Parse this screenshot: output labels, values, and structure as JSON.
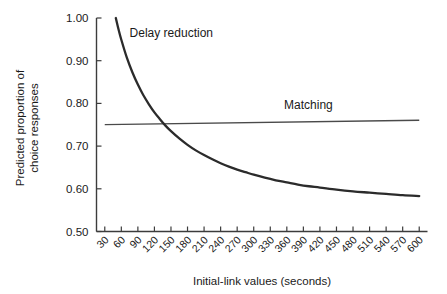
{
  "chart_data": {
    "type": "line",
    "title": "",
    "xlabel": "Initial-link values (seconds)",
    "ylabel": "Predicted proportion of choice responses",
    "xlim": [
      15,
      615
    ],
    "ylim": [
      0.5,
      1.0
    ],
    "grid": false,
    "legend_position": "inline-annotation",
    "xticks": [
      30,
      60,
      90,
      120,
      150,
      180,
      210,
      240,
      270,
      300,
      330,
      360,
      390,
      420,
      450,
      480,
      510,
      540,
      570,
      600
    ],
    "xtick_labels": [
      "30",
      "60",
      "90",
      "120",
      "150",
      "180",
      "210",
      "240",
      "270",
      "300",
      "330",
      "360",
      "390",
      "420",
      "450",
      "480",
      "510",
      "540",
      "570",
      "600"
    ],
    "xtick_rotation_deg": 45,
    "yticks": [
      0.5,
      0.6,
      0.7,
      0.8,
      0.9,
      1.0
    ],
    "ytick_labels": [
      "0.50",
      "0.60",
      "0.70",
      "0.80",
      "0.90",
      "1.00"
    ],
    "series": [
      {
        "name": "Delay reduction",
        "annotation": "Delay reduction",
        "annotation_x": 75,
        "annotation_y": 0.955,
        "color": "#2b2b2b",
        "x": [
          50,
          55,
          60,
          70,
          80,
          90,
          100,
          110,
          120,
          130,
          140,
          150,
          165,
          180,
          195,
          210,
          225,
          240,
          255,
          270,
          285,
          300,
          320,
          340,
          360,
          380,
          400,
          420,
          450,
          480,
          510,
          540,
          570,
          600
        ],
        "values": [
          1.0,
          0.973,
          0.949,
          0.907,
          0.873,
          0.844,
          0.819,
          0.798,
          0.779,
          0.763,
          0.748,
          0.735,
          0.718,
          0.703,
          0.69,
          0.679,
          0.669,
          0.66,
          0.652,
          0.645,
          0.639,
          0.633,
          0.626,
          0.62,
          0.615,
          0.61,
          0.606,
          0.603,
          0.598,
          0.594,
          0.591,
          0.588,
          0.585,
          0.583
        ]
      },
      {
        "name": "Matching",
        "annotation": "Matching",
        "annotation_x": 355,
        "annotation_y": 0.787,
        "color": "#4a4a4a",
        "x": [
          30,
          600
        ],
        "values": [
          0.7505,
          0.7605
        ]
      }
    ]
  }
}
